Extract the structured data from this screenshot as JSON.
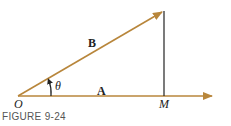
{
  "figure": {
    "caption": "FIGURE 9-24",
    "labels": {
      "origin": "O",
      "foot": "M",
      "vector_a": "A",
      "vector_b": "B",
      "angle": "θ"
    },
    "colors": {
      "vector": "#b8863b",
      "perpendicular": "#222222",
      "text": "#222222"
    }
  }
}
